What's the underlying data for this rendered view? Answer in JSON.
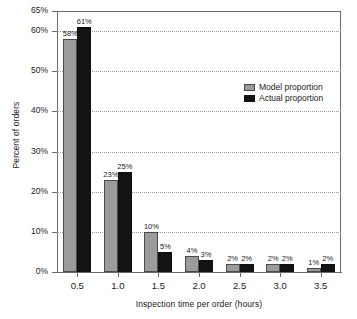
{
  "chart_data": {
    "type": "bar",
    "title": "",
    "xlabel": "Inspection time per order (hours)",
    "ylabel": "Percent of orders",
    "categories": [
      "0.5",
      "1.0",
      "1.5",
      "2.0",
      "2.5",
      "3.0",
      "3.5"
    ],
    "series": [
      {
        "name": "Model proportion",
        "color": "#9b9b9b",
        "values": [
          58,
          23,
          10,
          4,
          2,
          2,
          1
        ],
        "labels": [
          "58%",
          "23%",
          "10%",
          "4%",
          "2%",
          "2%",
          "1%"
        ]
      },
      {
        "name": "Actual proportion",
        "color": "#141414",
        "values": [
          61,
          25,
          5,
          3,
          2,
          2,
          2
        ],
        "labels": [
          "61%",
          "25%",
          "5%",
          "3%",
          "2%",
          "2%",
          "2%"
        ]
      }
    ],
    "ylim": [
      0,
      65
    ],
    "yticks": [
      0,
      10,
      20,
      30,
      40,
      50,
      60,
      65
    ],
    "ytick_labels": [
      "0%",
      "10%",
      "20%",
      "30%",
      "40%",
      "50%",
      "60%",
      "65%"
    ],
    "gridlines": [
      10,
      20,
      30,
      40,
      50,
      60
    ],
    "grid": true,
    "legend_position": "inside-upper-right"
  },
  "legend": {
    "entries": [
      {
        "label": "Model proportion"
      },
      {
        "label": "Actual proportion"
      }
    ]
  }
}
